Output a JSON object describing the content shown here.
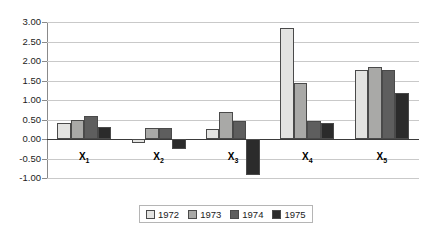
{
  "chart_data": {
    "type": "bar",
    "title": "",
    "subtitle": "",
    "xlabel": "",
    "ylabel": "",
    "categories": [
      "X1",
      "X2",
      "X3",
      "X4",
      "X5"
    ],
    "category_labels": [
      "X",
      "X",
      "X",
      "X",
      "X"
    ],
    "category_subscripts": [
      "1",
      "2",
      "3",
      "4",
      "5"
    ],
    "series": [
      {
        "name": "1972",
        "color": "#e3e3e1",
        "values": [
          0.41,
          -0.09,
          0.26,
          2.85,
          1.78
        ]
      },
      {
        "name": "1973",
        "color": "#a9a9a7",
        "values": [
          0.5,
          0.27,
          0.68,
          1.43,
          1.85
        ]
      },
      {
        "name": "1974",
        "color": "#5e5e5e",
        "values": [
          0.6,
          0.27,
          0.45,
          0.46,
          1.78
        ]
      },
      {
        "name": "1975",
        "color": "#2b2b2b",
        "values": [
          0.31,
          -0.25,
          -0.93,
          0.4,
          1.17
        ]
      }
    ],
    "ylim": [
      -1.0,
      3.0
    ],
    "yticks": [
      3.0,
      2.5,
      2.0,
      1.5,
      1.0,
      0.5,
      0.0,
      -0.5,
      -1.0
    ],
    "ytick_labels": [
      "3.00",
      "2.50",
      "2.00",
      "1.50",
      "1.00",
      "0.50",
      "0.00",
      "-0.50",
      "-1.00"
    ],
    "grid": true,
    "grid_color": "#c9c9c9",
    "zero_line_color": "#3a3a3a",
    "legend_position": "bottom-center",
    "bar_border_color": "#4a4a4a"
  }
}
